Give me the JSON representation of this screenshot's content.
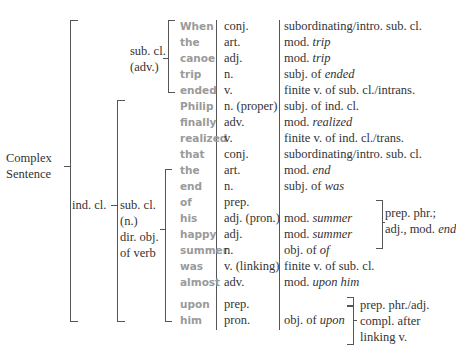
{
  "labels": {
    "root": [
      "Complex",
      "Sentence"
    ],
    "ind_cl": "ind. cl.",
    "sub_adv": [
      "sub. cl.",
      "(adv.)"
    ],
    "sub_n": [
      "sub. cl.",
      "(n.)",
      "dir. obj.",
      "of verb"
    ],
    "prep_phr1": [
      "prep. phr.;",
      "adj., mod. "
    ],
    "prep_phr1_em": "end",
    "prep_phr2": [
      "prep. phr./adj.",
      "compl. after",
      "linking v."
    ]
  },
  "rows": [
    {
      "word": "When",
      "pos": "conj.",
      "func": "subordinating/intro. sub. cl.",
      "func_em": ""
    },
    {
      "word": "the",
      "pos": "art.",
      "func": "mod. ",
      "func_em": "trip"
    },
    {
      "word": "canoe",
      "pos": "adj.",
      "func": "mod. ",
      "func_em": "trip"
    },
    {
      "word": "trip",
      "pos": "n.",
      "func": "subj. of ",
      "func_em": "ended"
    },
    {
      "word": "ended",
      "pos": "v.",
      "func": "finite v. of sub. cl./intrans.",
      "func_em": ""
    },
    {
      "word": "Philip",
      "pos": "n. (proper)",
      "func": "subj. of ind. cl.",
      "func_em": ""
    },
    {
      "word": "finally",
      "pos": "adv.",
      "func": "mod. ",
      "func_em": "realized"
    },
    {
      "word": "realized",
      "pos": "v.",
      "func": "finite v. of ind. cl./trans.",
      "func_em": ""
    },
    {
      "word": "that",
      "pos": "conj.",
      "func": "subordinating/intro. sub. cl.",
      "func_em": ""
    },
    {
      "word": "the",
      "pos": "art.",
      "func": "mod. ",
      "func_em": "end"
    },
    {
      "word": "end",
      "pos": "n.",
      "func": "subj. of ",
      "func_em": "was"
    },
    {
      "word": "of",
      "pos": "prep.",
      "func": "",
      "func_em": ""
    },
    {
      "word": "his",
      "pos": "adj. (pron.)",
      "func": "mod. ",
      "func_em": "summer"
    },
    {
      "word": "happy",
      "pos": "adj.",
      "func": "mod. ",
      "func_em": "summer"
    },
    {
      "word": "summer",
      "pos": "n.",
      "func": "obj. of ",
      "func_em": "of"
    },
    {
      "word": "was",
      "pos": "v. (linking)",
      "func": "finite v. of sub. cl.",
      "func_em": ""
    },
    {
      "word": "almost",
      "pos": "adv.",
      "func": "mod. ",
      "func_em": "upon him"
    },
    {
      "word": "upon",
      "pos": "prep.",
      "func": "",
      "func_em": ""
    },
    {
      "word": "him",
      "pos": "pron.",
      "func": "obj. of ",
      "func_em": "upon"
    }
  ],
  "colors": {
    "line": "#555555",
    "word": "#9a9a9a",
    "text": "#333333"
  }
}
